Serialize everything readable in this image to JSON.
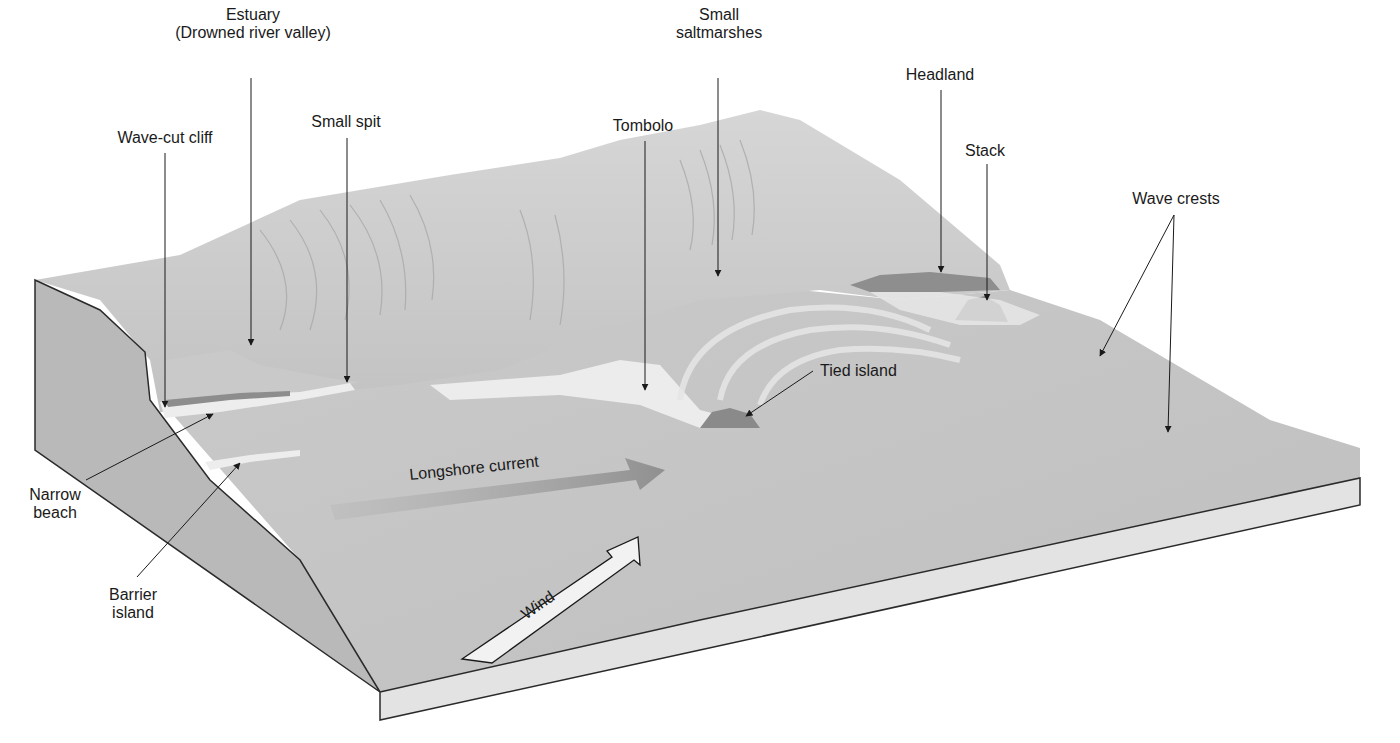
{
  "diagram": {
    "type": "block-diagram",
    "labels": [
      {
        "id": "estuary",
        "lines": [
          "Estuary",
          "(Drowned river valley)"
        ],
        "x": 253,
        "y": 38
      },
      {
        "id": "small-saltmarshes",
        "lines": [
          "Small",
          "saltmarshes"
        ],
        "x": 719,
        "y": 38
      },
      {
        "id": "headland",
        "lines": [
          "Headland"
        ],
        "x": 935,
        "y": 70
      },
      {
        "id": "small-spit",
        "lines": [
          "Small spit"
        ],
        "x": 346,
        "y": 117
      },
      {
        "id": "tombolo",
        "lines": [
          "Tombolo"
        ],
        "x": 638,
        "y": 120
      },
      {
        "id": "wave-cut-cliff",
        "lines": [
          "Wave-cut cliff"
        ],
        "x": 165,
        "y": 133
      },
      {
        "id": "stack",
        "lines": [
          "Stack"
        ],
        "x": 985,
        "y": 144
      },
      {
        "id": "wave-crests",
        "lines": [
          "Wave crests"
        ],
        "x": 1176,
        "y": 190
      },
      {
        "id": "tied-island",
        "lines": [
          "Tied island"
        ],
        "x": 863,
        "y": 370
      },
      {
        "id": "narrow-beach",
        "lines": [
          "Narrow",
          "beach"
        ],
        "x": 50,
        "y": 483
      },
      {
        "id": "barrier-island",
        "lines": [
          "Barrier",
          "island"
        ],
        "x": 133,
        "y": 597
      }
    ],
    "flow_arrows": [
      {
        "id": "longshore-current",
        "label": "Longshore current"
      },
      {
        "id": "wind",
        "label": "Wind"
      }
    ],
    "colors": {
      "background": "#ffffff",
      "land_light": "#d9d9d9",
      "land_mid": "#bdbdbd",
      "water": "#c4c4c4",
      "beach": "#ececec",
      "cross_section": "#b8b8b8",
      "slab_side": "#e2e2e2",
      "rock": "#7a7a7a",
      "line": "#222222"
    }
  }
}
